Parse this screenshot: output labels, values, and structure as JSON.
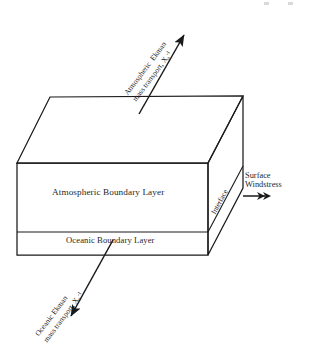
{
  "figure": {
    "type": "schematic-diagram",
    "background_color": "#ffffff",
    "ink_color": "#1a1a1a"
  },
  "box_labels": {
    "atmospheric_layer": "Atmospheric Boundary Layer",
    "oceanic_layer": "Oceanic Boundary Layer"
  },
  "annotations": {
    "atmospheric_ekman": {
      "line1": "Atmospheric  Ekman",
      "line2": "mass transport, X",
      "subscript": "a",
      "superscript": "-1"
    },
    "oceanic_ekman": {
      "line1": "Oceanic Ekman",
      "line2": "mass transport, X",
      "subscript": "o",
      "superscript": "-1"
    },
    "interface": "Interface",
    "surface_windstress": {
      "line1": "Surface",
      "line2": "Windstress"
    }
  },
  "arrows": {
    "atmospheric_ekman_direction": "up-right",
    "oceanic_ekman_direction": "down-left",
    "windstress_direction": "right-double-head"
  },
  "geometry": {
    "front_top_left": [
      17,
      163
    ],
    "front_top_right": [
      208,
      163
    ],
    "front_bottom_left": [
      17,
      255
    ],
    "front_bottom_right": [
      208,
      255
    ],
    "back_top_left": [
      50,
      97
    ],
    "back_top_right": [
      243,
      96
    ],
    "interface_y_front": 232,
    "back_bottom_right": [
      243,
      188
    ]
  }
}
